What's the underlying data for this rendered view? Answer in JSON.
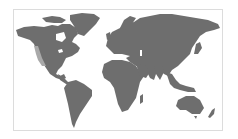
{
  "map": {
    "type": "world-map",
    "projection": "equirectangular",
    "land_color": "#6e6e6e",
    "highlight_color": "#a9a9a9",
    "background_color": "#ffffff",
    "border_color": "#dcdcdc",
    "highlighted_regions": [
      "US West Coast"
    ]
  }
}
